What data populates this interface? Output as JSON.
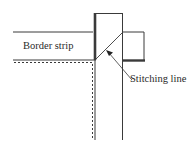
{
  "diagram": {
    "type": "quilt-binding-corner-illustration",
    "labels": {
      "border_strip": "Border strip",
      "stitching_line": "Stitching line"
    },
    "colors": {
      "line": "#3a3a3a",
      "background": "#ffffff"
    }
  }
}
